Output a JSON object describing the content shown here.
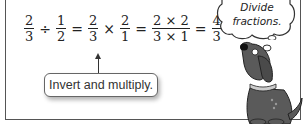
{
  "equation": {
    "terms": [
      {
        "num": "2",
        "den": "3"
      },
      {
        "op": "÷"
      },
      {
        "num": "1",
        "den": "2"
      },
      {
        "op": "="
      },
      {
        "num": "2",
        "den": "3"
      },
      {
        "op": "×"
      },
      {
        "num": "2",
        "den": "1"
      },
      {
        "op": "="
      },
      {
        "num": "2 × 2",
        "den": "3 × 1"
      },
      {
        "op": "="
      },
      {
        "num": "4",
        "den": "3"
      }
    ]
  },
  "callout": {
    "label": "Invert and multiply."
  },
  "thought_bubble": {
    "line1": "Divide",
    "line2": "fractions."
  },
  "colors": {
    "frame": "#555555",
    "dog": "#5a5a5a",
    "text": "#222222"
  }
}
